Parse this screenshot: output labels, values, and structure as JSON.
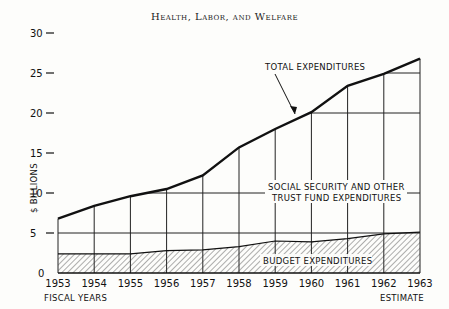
{
  "header": {
    "title": "Health, Labor, and Welfare"
  },
  "chart_data": {
    "type": "area",
    "title": "Health, Labor, and Welfare",
    "xlabel": "FISCAL YEARS",
    "ylabel": "$ BILLIONS",
    "x_note": "ESTIMATE",
    "categories": [
      "1953",
      "1954",
      "1955",
      "1956",
      "1957",
      "1958",
      "1959",
      "1960",
      "1961",
      "1962",
      "1963"
    ],
    "yticks": [
      0,
      5,
      10,
      15,
      20,
      25,
      30
    ],
    "ylim": [
      0,
      30
    ],
    "series": [
      {
        "name": "TOTAL EXPENDITURES",
        "values": [
          6.8,
          8.4,
          9.6,
          10.5,
          12.2,
          15.7,
          18.0,
          20.1,
          23.4,
          24.9,
          26.8
        ]
      },
      {
        "name": "BUDGET EXPENDITURES",
        "values": [
          2.4,
          2.4,
          2.4,
          2.8,
          2.9,
          3.3,
          4.0,
          3.9,
          4.3,
          4.9,
          5.1
        ]
      }
    ],
    "annotations": [
      "TOTAL EXPENDITURES",
      "SOCIAL SECURITY AND OTHER TRUST FUND EXPENDITURES",
      "BUDGET EXPENDITURES"
    ],
    "grid": true,
    "legend": "none"
  },
  "labels": {
    "total": "TOTAL EXPENDITURES",
    "trust1": "SOCIAL SECURITY AND OTHER",
    "trust2": "TRUST FUND EXPENDITURES",
    "budget": "BUDGET EXPENDITURES",
    "xlabel": "FISCAL YEARS",
    "ylabel": "$ BILLIONS",
    "estimate": "ESTIMATE"
  }
}
